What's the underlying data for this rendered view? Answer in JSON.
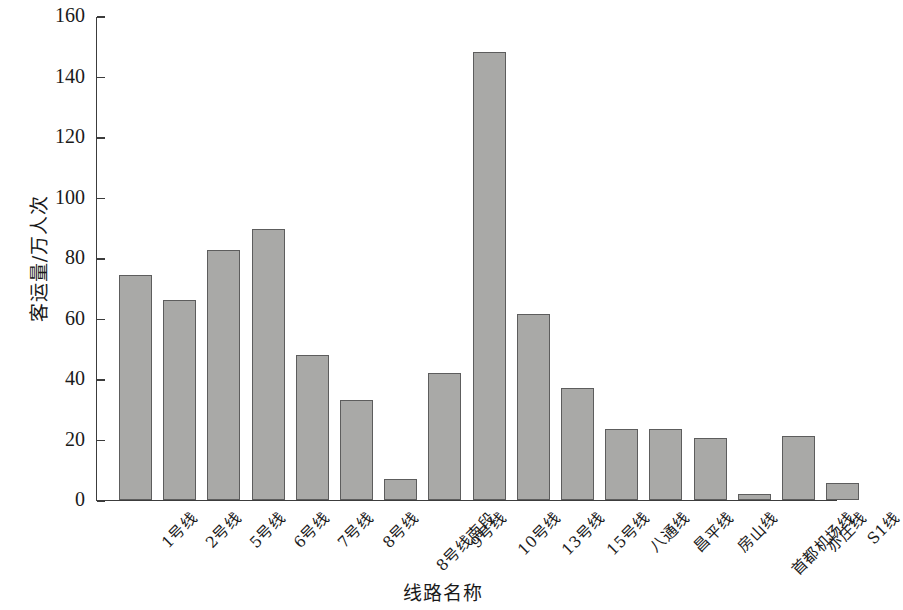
{
  "chart_data": {
    "type": "bar",
    "title": "",
    "xlabel": "线路名称",
    "ylabel": "客运量/万人次",
    "ylim": [
      0,
      160
    ],
    "ytick_step": 20,
    "yticks": [
      0,
      20,
      40,
      60,
      80,
      100,
      120,
      140,
      160
    ],
    "grid": false,
    "legend": "none",
    "bar_color": "#a9a9a7",
    "bar_edge_color": "#5d5d5d",
    "axis_color": "#3c3c3c",
    "categories": [
      "1号线",
      "2号线",
      "5号线",
      "6号线",
      "7号线",
      "8号线",
      "8号线南段",
      "9号线",
      "10号线",
      "13号线",
      "15号线",
      "八通线",
      "昌平线",
      "房山线",
      "首都机场线",
      "亦庄线",
      "S1线"
    ],
    "values": [
      74.5,
      66,
      82.5,
      89.5,
      48,
      33,
      7,
      42,
      148,
      61.5,
      37,
      23.5,
      23.5,
      20.5,
      2,
      21,
      5.5
    ]
  }
}
